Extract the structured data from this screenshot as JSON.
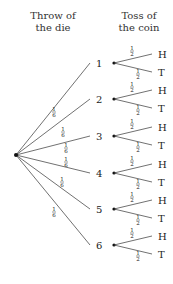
{
  "headers": {
    "die": [
      "Throw of",
      "the die"
    ],
    "coin": [
      "Toss of",
      "the coin"
    ]
  },
  "root": {
    "x": 16,
    "y": 155
  },
  "die_branches": [
    {
      "label": "1",
      "prob": "1/6",
      "y": 63
    },
    {
      "label": "2",
      "prob": "1/6",
      "y": 99
    },
    {
      "label": "3",
      "prob": "1/6",
      "y": 136
    },
    {
      "label": "4",
      "prob": "1/6",
      "y": 173
    },
    {
      "label": "5",
      "prob": "1/6",
      "y": 209
    },
    {
      "label": "6",
      "prob": "1/6",
      "y": 245
    }
  ],
  "coin_branches": [
    {
      "label": "H",
      "prob": "1/2"
    },
    {
      "label": "T",
      "prob": "1/2"
    }
  ],
  "colors": {
    "line": "#333333",
    "text": "#222222"
  }
}
